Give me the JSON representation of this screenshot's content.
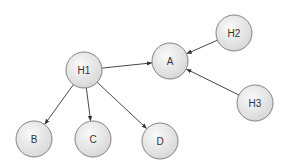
{
  "diagram": {
    "type": "directed-graph",
    "node_radius": 18,
    "colors": {
      "node_fill_light": "#fafafa",
      "node_fill_dark": "#d6d6d6",
      "node_stroke": "#777777",
      "edge_stroke": "#333333",
      "label": "#333333"
    },
    "nodes": [
      {
        "id": "H1",
        "label": "H1",
        "cx": 84,
        "cy": 70
      },
      {
        "id": "A",
        "label": "A",
        "cx": 170,
        "cy": 61
      },
      {
        "id": "H2",
        "label": "H2",
        "cx": 234,
        "cy": 33
      },
      {
        "id": "H3",
        "label": "H3",
        "cx": 255,
        "cy": 103
      },
      {
        "id": "B",
        "label": "B",
        "cx": 34,
        "cy": 139
      },
      {
        "id": "C",
        "label": "C",
        "cx": 93,
        "cy": 139
      },
      {
        "id": "D",
        "label": "D",
        "cx": 160,
        "cy": 141
      }
    ],
    "edges": [
      {
        "from": "H1",
        "to": "A"
      },
      {
        "from": "H2",
        "to": "A"
      },
      {
        "from": "H3",
        "to": "A"
      },
      {
        "from": "H1",
        "to": "B"
      },
      {
        "from": "H1",
        "to": "C"
      },
      {
        "from": "H1",
        "to": "D"
      }
    ]
  }
}
